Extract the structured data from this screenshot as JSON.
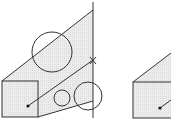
{
  "diagram": {
    "colors": {
      "stroke": "#333333",
      "fill": "#e8e8e8",
      "background": "#ffffff"
    },
    "left_figure": {
      "square": {
        "x": 2,
        "y": 81,
        "w": 36,
        "h": 36
      },
      "cone_polygon": "2,81 93,10 93,101 38,117",
      "vertical_line": {
        "x": 93,
        "y1": 2,
        "y2": 118
      },
      "big_circle": {
        "cx": 52,
        "cy": 52,
        "r": 20
      },
      "small_circle": {
        "cx": 62,
        "cy": 98,
        "r": 8
      },
      "medium_circle": {
        "cx": 88,
        "cy": 96,
        "r": 14
      },
      "ray": {
        "x1": 28,
        "y1": 106,
        "x2": 93,
        "y2": 60
      },
      "dot": {
        "cx": 28,
        "cy": 106
      },
      "x_marker": {
        "x": 93,
        "y": 60,
        "label": "×"
      }
    },
    "right_figure": {
      "square": {
        "x": 133,
        "y": 82,
        "w": 38,
        "h": 36
      },
      "cone_edge": {
        "x1": 133,
        "y1": 82,
        "x2": 171,
        "y2": 53
      },
      "ray": {
        "x1": 160,
        "y1": 108,
        "x2": 171,
        "y2": 100
      },
      "dot": {
        "cx": 160,
        "cy": 108
      }
    }
  }
}
